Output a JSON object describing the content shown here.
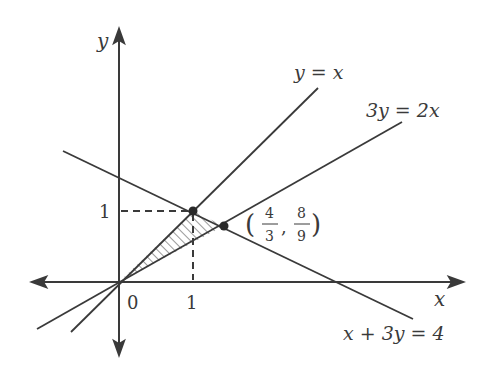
{
  "diagram": {
    "type": "coordinate-plane-region",
    "axes": {
      "x_label": "x",
      "y_label": "y",
      "origin_label": "0",
      "x_tick_label": "1",
      "y_tick_label": "1"
    },
    "lines": [
      {
        "id": "line-y-eq-x",
        "label": "y = x"
      },
      {
        "id": "line-3y-eq-2x",
        "label": "3y = 2x"
      },
      {
        "id": "line-x-plus-3y-eq-4",
        "label": "x + 3y = 4"
      }
    ],
    "points": [
      {
        "id": "point-1-1",
        "coords": "(1, 1)"
      },
      {
        "id": "point-4-3-8-9",
        "x_num": "4",
        "x_den": "3",
        "y_num": "8",
        "y_den": "9"
      }
    ],
    "shaded_region": "triangle with vertices (0,0), (1,1), (4/3, 8/9)",
    "colors": {
      "ink": "#3a3a3a",
      "background": "#ffffff"
    }
  }
}
